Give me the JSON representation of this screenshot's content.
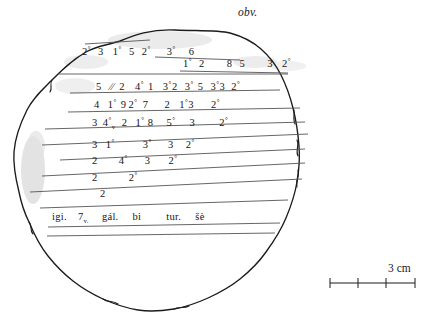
{
  "figure": {
    "face_label": "obv.",
    "scale": {
      "label": "3 cm",
      "segments": 3,
      "unit": "cm",
      "total_length_cm": 3
    },
    "ink_color": "#1a1a1a",
    "rule_color": "#555555",
    "smudge_color": "#d9d9d9"
  },
  "transliteration": {
    "lines": [
      {
        "id": "line-1",
        "text": "2° 3 1° 5 2°    3°   6",
        "tokens": [
          {
            "v": "2",
            "deg": true
          },
          {
            "v": "3",
            "deg": false
          },
          {
            "v": "1",
            "deg": true
          },
          {
            "v": "5",
            "deg": false
          },
          {
            "v": "2",
            "deg": true
          },
          {
            "v": "3",
            "deg": true
          },
          {
            "v": "6",
            "deg": false
          }
        ]
      },
      {
        "id": "line-2",
        "text": "1° 2    8 5    3  2°",
        "tokens": [
          {
            "v": "1",
            "deg": true
          },
          {
            "v": "2",
            "deg": false
          },
          {
            "v": "8",
            "deg": false
          },
          {
            "v": "5",
            "deg": false
          },
          {
            "v": "3",
            "deg": false
          },
          {
            "v": "2",
            "deg": true
          }
        ]
      },
      {
        "id": "line-3",
        "text": "5 // 2  4° 1  3°2  3° 5  3°3  2°",
        "tokens": [
          {
            "v": "5",
            "deg": false
          },
          {
            "v": "//",
            "deg": false
          },
          {
            "v": "2",
            "deg": false
          },
          {
            "v": "4",
            "deg": true
          },
          {
            "v": "1",
            "deg": false
          },
          {
            "v": "3",
            "deg": true
          },
          {
            "v": "2",
            "deg": false
          },
          {
            "v": "3",
            "deg": true
          },
          {
            "v": "5",
            "deg": false
          },
          {
            "v": "3",
            "deg": true
          },
          {
            "v": "3",
            "deg": false
          },
          {
            "v": "2",
            "deg": true
          }
        ]
      },
      {
        "id": "line-4",
        "text": "4  1° 9 2°  7    2  1°3    2°",
        "tokens": [
          {
            "v": "4",
            "deg": false
          },
          {
            "v": "1",
            "deg": true
          },
          {
            "v": "9",
            "deg": false
          },
          {
            "v": "2",
            "deg": true
          },
          {
            "v": "7",
            "deg": false
          },
          {
            "v": "2",
            "deg": false
          },
          {
            "v": "1",
            "deg": true
          },
          {
            "v": "3",
            "deg": false
          },
          {
            "v": "2",
            "deg": true
          }
        ]
      },
      {
        "id": "line-5",
        "text": "3  4°v  2  1° 8   5°   3     2°",
        "tokens": [
          {
            "v": "3",
            "deg": false
          },
          {
            "v": "4",
            "deg": true,
            "sub": "v"
          },
          {
            "v": "2",
            "deg": false
          },
          {
            "v": "1",
            "deg": true
          },
          {
            "v": "8",
            "deg": false
          },
          {
            "v": "5",
            "deg": true
          },
          {
            "v": "3",
            "deg": false
          },
          {
            "v": "2",
            "deg": true
          }
        ]
      },
      {
        "id": "line-6",
        "text": "3  1°     3°   3  2°",
        "tokens": [
          {
            "v": "3",
            "deg": false
          },
          {
            "v": "1",
            "deg": true
          },
          {
            "v": "3",
            "deg": true
          },
          {
            "v": "3",
            "deg": false
          },
          {
            "v": "2",
            "deg": true
          }
        ]
      },
      {
        "id": "line-7",
        "text": "2    4°   3   2°",
        "tokens": [
          {
            "v": "2",
            "deg": false
          },
          {
            "v": "4",
            "deg": true
          },
          {
            "v": "3",
            "deg": false
          },
          {
            "v": "2",
            "deg": true
          }
        ]
      },
      {
        "id": "line-8",
        "text": "2      2°",
        "tokens": [
          {
            "v": "2",
            "deg": false
          },
          {
            "v": "2",
            "deg": true
          }
        ]
      },
      {
        "id": "line-9",
        "text": "2",
        "tokens": [
          {
            "v": "2",
            "deg": false
          }
        ]
      }
    ],
    "colophon": {
      "id": "line-colophon",
      "text": "igi.  7v.   gál.   bi      tur.   šè",
      "words": [
        "igi.",
        "7v.",
        "gál.",
        "bi",
        "tur.",
        "šè"
      ]
    }
  }
}
